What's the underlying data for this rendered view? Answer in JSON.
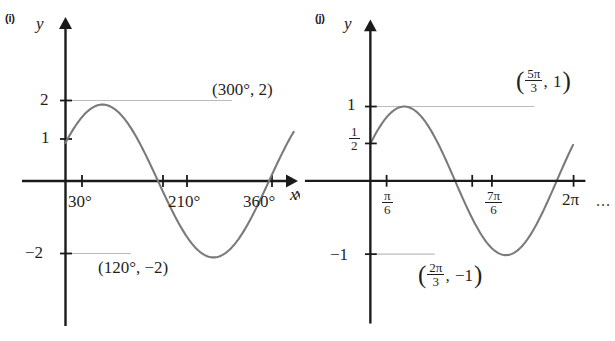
{
  "figure": {
    "kind": "two-panel-trigonometric-graphs",
    "background": "#ffffff",
    "curve_color": "#7a7a7a",
    "axis_color": "#1a1a1a",
    "guide_color": "#b9b9b9",
    "ellipsis": "..."
  },
  "panels": [
    {
      "id": "i",
      "tag": "(i)",
      "y_axis_label": "y",
      "x_axis_label": "x",
      "y_ticks": [
        "2",
        "1",
        "−2"
      ],
      "x_ticks": [
        "30°",
        "210°",
        "360°"
      ],
      "max_point_label": "(300°, 2)",
      "min_point_label": "(120°, −2)"
    },
    {
      "id": "j",
      "tag": "(j)",
      "y_axis_label": "y",
      "x_axis_label": "x",
      "y_ticks": [
        "1",
        "1/2",
        "−1"
      ],
      "x_ticks": [
        "π/6",
        "7π/6",
        "2π"
      ],
      "max_point_label": "(5π/3, 1)",
      "min_point_label": "(2π/3, −1)",
      "half_fraction": {
        "numerator": "1",
        "denominator": "2"
      },
      "tick_pi_over_6": {
        "numerator": "π",
        "denominator": "6"
      },
      "tick_7pi_over_6": {
        "numerator": "7π",
        "denominator": "6"
      },
      "tick_2pi": "2π",
      "max_fraction": {
        "numerator": "5π",
        "denominator": "3"
      },
      "max_value": "1",
      "min_fraction": {
        "numerator": "2π",
        "denominator": "3"
      },
      "min_value": "−1"
    }
  ],
  "chart_data": [
    {
      "type": "line",
      "title": "(i)",
      "xlabel": "x",
      "ylabel": "y",
      "xlim": [
        0,
        390
      ],
      "ylim": [
        -2.6,
        2.6
      ],
      "xticks": [
        30,
        210,
        360
      ],
      "xticklabels": [
        "30°",
        "210°",
        "360°"
      ],
      "yticks": [
        2,
        1,
        -2
      ],
      "yticklabels": [
        "2",
        "1",
        "−2"
      ],
      "grid": false,
      "legend": null,
      "series": [
        {
          "name": "y = 2 sin(x + 30°)",
          "description": "sinusoid amplitude 2, period 360°, starts at y = 1 when x = 0",
          "amplitude": 2,
          "period_degrees": 360,
          "phase_shift_degrees": 30,
          "y_intercept": 1,
          "x_start": 0,
          "x_end": 390,
          "key_points": [
            {
              "x": 0,
              "y": 1,
              "label": ""
            },
            {
              "x": 120,
              "y": -2,
              "label": "(120°, −2)"
            },
            {
              "x": 210,
              "y": 0,
              "label": ""
            },
            {
              "x": 300,
              "y": 2,
              "label": "(300°, 2)"
            }
          ],
          "zeros_degrees": [
            30,
            210
          ],
          "minimum": {
            "x": 120,
            "y": -2
          },
          "maximum": {
            "x": 300,
            "y": 2
          }
        }
      ],
      "annotations": [
        "(300°, 2)",
        "(120°, −2)"
      ],
      "guide_lines": [
        {
          "y": 2,
          "from_x": 0,
          "to_x": 300,
          "style": "dotted"
        },
        {
          "y": -2,
          "from_x": 0,
          "to_x": 120,
          "style": "dotted"
        }
      ]
    },
    {
      "type": "line",
      "title": "(j)",
      "xlabel": "x",
      "ylabel": "y",
      "xlim": [
        0,
        6.98
      ],
      "ylim": [
        -1.3,
        1.3
      ],
      "xticks": [
        0.5236,
        3.6652,
        6.2832
      ],
      "xticklabels": [
        "π/6",
        "7π/6",
        "2π"
      ],
      "yticks": [
        1,
        0.5,
        -1
      ],
      "yticklabels": [
        "1",
        "1/2",
        "−1"
      ],
      "grid": false,
      "legend": null,
      "series": [
        {
          "name": "y = sin(x + π/6)",
          "description": "sinusoid amplitude 1, period 2π, starts at y = 1/2 when x = 0",
          "amplitude": 1,
          "period_radians": 6.2832,
          "phase_shift_radians": 0.5236,
          "y_intercept": 0.5,
          "x_start": 0,
          "x_end": 6.98,
          "key_points": [
            {
              "x": 0,
              "y": 0.5,
              "label": ""
            },
            {
              "x": 2.0944,
              "y": -1,
              "label": "(2π/3, −1)"
            },
            {
              "x": 3.6652,
              "y": 0,
              "label": ""
            },
            {
              "x": 5.236,
              "y": 1,
              "label": "(5π/3, 1)"
            }
          ],
          "zeros_radians": [
            0.5236,
            3.6652
          ],
          "minimum": {
            "x": 2.0944,
            "y": -1
          },
          "maximum": {
            "x": 5.236,
            "y": 1
          }
        }
      ],
      "annotations": [
        "(5π/3, 1)",
        "(2π/3, −1)"
      ],
      "guide_lines": [
        {
          "y": 1,
          "from_x": 0,
          "to_x": 5.236,
          "style": "dotted"
        },
        {
          "y": -1,
          "from_x": 0,
          "to_x": 2.0944,
          "style": "dotted"
        }
      ]
    }
  ]
}
